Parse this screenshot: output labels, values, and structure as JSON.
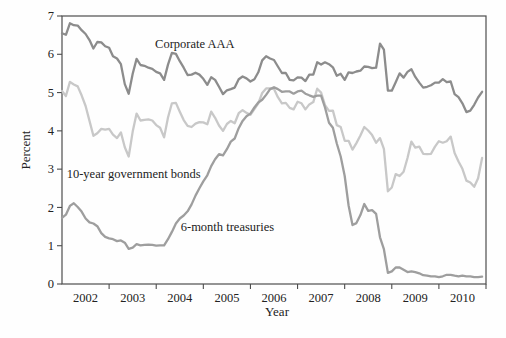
{
  "figure": {
    "background": "#fefefe",
    "frame_color": "#4d4d4d",
    "tick_color": "#4d4d4d",
    "text_color": "#222222"
  },
  "chart_data": {
    "type": "line",
    "title": "",
    "xlabel": "Year",
    "ylabel": "Percent",
    "xlim": [
      2002,
      2011
    ],
    "ylim": [
      0,
      7
    ],
    "x_start_year": 2002,
    "x_step_months": 1,
    "grid": "off",
    "legend_position": "inline-annotations",
    "y_ticks": [
      0,
      1,
      2,
      3,
      4,
      5,
      6,
      7
    ],
    "x_tick_labels": [
      "2002",
      "2003",
      "2004",
      "2005",
      "2006",
      "2007",
      "2008",
      "2009",
      "2010"
    ],
    "series": [
      {
        "name": "10-year government bonds",
        "color": "#c8c8c8",
        "values": [
          5.04,
          4.91,
          5.28,
          5.21,
          5.16,
          4.93,
          4.65,
          4.26,
          3.87,
          3.94,
          4.05,
          4.03,
          4.05,
          3.9,
          3.81,
          3.96,
          3.57,
          3.33,
          3.98,
          4.45,
          4.27,
          4.29,
          4.3,
          4.27,
          4.15,
          4.08,
          3.83,
          4.35,
          4.72,
          4.73,
          4.5,
          4.28,
          4.13,
          4.1,
          4.19,
          4.23,
          4.22,
          4.17,
          4.5,
          4.34,
          4.14,
          4.0,
          4.18,
          4.26,
          4.2,
          4.46,
          4.54,
          4.47,
          4.42,
          4.57,
          4.72,
          4.99,
          5.11,
          5.11,
          5.09,
          4.88,
          4.72,
          4.73,
          4.6,
          4.56,
          4.76,
          4.72,
          4.56,
          4.69,
          4.75,
          5.1,
          5.0,
          4.67,
          4.52,
          4.53,
          4.15,
          4.1,
          3.74,
          3.74,
          3.51,
          3.68,
          3.88,
          4.1,
          4.01,
          3.89,
          3.69,
          3.81,
          3.53,
          2.42,
          2.52,
          2.87,
          2.82,
          2.93,
          3.29,
          3.72,
          3.56,
          3.59,
          3.4,
          3.39,
          3.4,
          3.59,
          3.73,
          3.69,
          3.73,
          3.85,
          3.42,
          3.2,
          3.01,
          2.7,
          2.65,
          2.54,
          2.76,
          3.29
        ]
      },
      {
        "name": "Corporate AAA",
        "color": "#8c8c8c",
        "values": [
          6.55,
          6.51,
          6.81,
          6.76,
          6.75,
          6.63,
          6.53,
          6.37,
          6.15,
          6.32,
          6.31,
          6.21,
          6.17,
          5.95,
          5.89,
          5.74,
          5.22,
          4.97,
          5.49,
          5.88,
          5.72,
          5.7,
          5.65,
          5.62,
          5.54,
          5.5,
          5.33,
          5.73,
          6.04,
          6.01,
          5.82,
          5.65,
          5.46,
          5.47,
          5.52,
          5.47,
          5.36,
          5.2,
          5.4,
          5.33,
          5.15,
          4.96,
          5.06,
          5.09,
          5.13,
          5.35,
          5.42,
          5.37,
          5.29,
          5.35,
          5.53,
          5.84,
          5.95,
          5.89,
          5.85,
          5.68,
          5.51,
          5.51,
          5.33,
          5.32,
          5.4,
          5.39,
          5.3,
          5.47,
          5.47,
          5.79,
          5.73,
          5.79,
          5.74,
          5.66,
          5.44,
          5.49,
          5.33,
          5.53,
          5.51,
          5.55,
          5.57,
          5.68,
          5.67,
          5.64,
          5.65,
          6.28,
          6.12,
          5.05,
          5.05,
          5.27,
          5.5,
          5.39,
          5.54,
          5.61,
          5.41,
          5.26,
          5.13,
          5.15,
          5.19,
          5.26,
          5.26,
          5.35,
          5.27,
          5.29,
          4.96,
          4.88,
          4.72,
          4.49,
          4.53,
          4.68,
          4.87,
          5.02
        ]
      },
      {
        "name": "6-month treasuries",
        "color": "#9e9e9e",
        "values": [
          1.73,
          1.81,
          2.04,
          2.11,
          2.01,
          1.89,
          1.71,
          1.61,
          1.58,
          1.51,
          1.33,
          1.23,
          1.19,
          1.17,
          1.12,
          1.14,
          1.08,
          0.92,
          0.95,
          1.04,
          1.01,
          1.02,
          1.03,
          1.02,
          1.0,
          1.01,
          1.01,
          1.17,
          1.36,
          1.58,
          1.71,
          1.79,
          1.9,
          2.08,
          2.31,
          2.5,
          2.68,
          2.84,
          3.08,
          3.26,
          3.39,
          3.36,
          3.52,
          3.72,
          3.8,
          4.07,
          4.26,
          4.38,
          4.45,
          4.61,
          4.74,
          4.81,
          4.94,
          5.09,
          5.14,
          5.09,
          5.02,
          5.03,
          5.03,
          4.97,
          5.03,
          5.05,
          4.97,
          4.93,
          4.89,
          4.92,
          4.92,
          4.61,
          4.21,
          4.08,
          3.67,
          3.33,
          2.82,
          2.05,
          1.54,
          1.59,
          1.8,
          2.09,
          1.91,
          1.93,
          1.83,
          1.22,
          0.91,
          0.29,
          0.33,
          0.43,
          0.43,
          0.37,
          0.31,
          0.33,
          0.31,
          0.28,
          0.23,
          0.22,
          0.2,
          0.2,
          0.18,
          0.2,
          0.24,
          0.24,
          0.22,
          0.2,
          0.22,
          0.2,
          0.2,
          0.18,
          0.18,
          0.19
        ]
      }
    ],
    "annotations": [
      {
        "text": "Corporate AAA",
        "x": 2004.82,
        "y": 6.27,
        "anchor": "middle"
      },
      {
        "text": "10-year government bonds",
        "x": 2002.1,
        "y": 2.88,
        "anchor": "start"
      },
      {
        "text": "6-month treasuries",
        "x": 2004.52,
        "y": 1.48,
        "anchor": "start"
      }
    ]
  }
}
